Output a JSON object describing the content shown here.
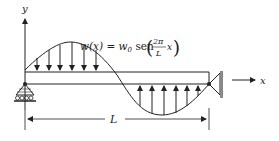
{
  "diagram": {
    "type": "beam-loading",
    "axes": {
      "y_label": "y",
      "x_label": "x"
    },
    "load": {
      "equation_lhs": "w(x) = w",
      "equation_sub": "0",
      "equation_func": " sen",
      "frac_num": "2π",
      "frac_den": "L",
      "frac_var": "x",
      "description": "sinusoidal distributed load, downward over first half, upward over second half"
    },
    "dimension": {
      "label": "L"
    },
    "supports": {
      "left": "roller-support",
      "right": "fixed-wall-pin"
    },
    "colors": {
      "line": "#222222",
      "wall": "#888888"
    }
  }
}
